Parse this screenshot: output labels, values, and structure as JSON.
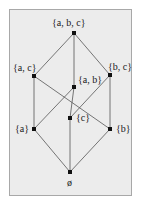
{
  "diagram": {
    "nodes": [
      {
        "id": "abc",
        "label": "{a, b, c}",
        "x": 74,
        "y": 33,
        "lx": 52,
        "ly": 18
      },
      {
        "id": "ac",
        "label": "{a, c}",
        "x": 34,
        "y": 76,
        "lx": 13,
        "ly": 63
      },
      {
        "id": "bc",
        "label": "{b, c}",
        "x": 110,
        "y": 75,
        "lx": 108,
        "ly": 62
      },
      {
        "id": "ab",
        "label": "{a, b}",
        "x": 74,
        "y": 87,
        "lx": 78,
        "ly": 75
      },
      {
        "id": "c",
        "label": "{c}",
        "x": 70,
        "y": 118,
        "lx": 76,
        "ly": 113
      },
      {
        "id": "a",
        "label": "{a}",
        "x": 34,
        "y": 129,
        "lx": 15,
        "ly": 124
      },
      {
        "id": "b",
        "label": "{b}",
        "x": 110,
        "y": 129,
        "lx": 116,
        "ly": 124
      },
      {
        "id": "empty",
        "label": "ø",
        "x": 70,
        "y": 172,
        "lx": 67,
        "ly": 178
      }
    ],
    "edges": [
      [
        "abc",
        "ac"
      ],
      [
        "abc",
        "bc"
      ],
      [
        "abc",
        "ab"
      ],
      [
        "ac",
        "a"
      ],
      [
        "ac",
        "b"
      ],
      [
        "bc",
        "c"
      ],
      [
        "bc",
        "b"
      ],
      [
        "ab",
        "a"
      ],
      [
        "ab",
        "c"
      ],
      [
        "a",
        "empty"
      ],
      [
        "b",
        "empty"
      ],
      [
        "c",
        "empty"
      ]
    ],
    "colors": {
      "panel": "#ececec",
      "edge": "#555555",
      "node": "#111111"
    }
  }
}
